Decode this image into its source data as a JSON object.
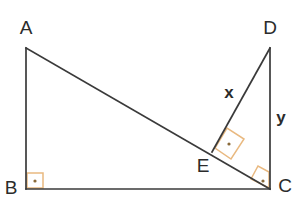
{
  "figure": {
    "background_color": "#ffffff",
    "line_color": "#3a3a3a",
    "label_color": "#2b2b2b",
    "angle_mark_color": "#e9b980",
    "angle_dot_color": "#8a6a3a",
    "vertices": [
      {
        "id": "A",
        "label": "A",
        "x": 26,
        "y": 48,
        "label_x": 26,
        "label_y": 34
      },
      {
        "id": "B",
        "label": "B",
        "x": 26,
        "y": 189,
        "label_x": 11,
        "label_y": 194
      },
      {
        "id": "C",
        "label": "C",
        "x": 270,
        "y": 189,
        "label_x": 285,
        "label_y": 192
      },
      {
        "id": "D",
        "label": "D",
        "x": 270,
        "y": 48,
        "label_x": 270,
        "label_y": 34
      },
      {
        "id": "E",
        "label": "E",
        "x": 212,
        "y": 152,
        "label_x": 203,
        "label_y": 172
      }
    ],
    "segments": [
      {
        "id": "AB",
        "from": "A",
        "to": "B",
        "x1": 26,
        "y1": 48,
        "x2": 26,
        "y2": 189
      },
      {
        "id": "BC",
        "from": "B",
        "to": "C",
        "x1": 26,
        "y1": 189,
        "x2": 270,
        "y2": 189
      },
      {
        "id": "AC",
        "from": "A",
        "to": "C",
        "x1": 26,
        "y1": 48,
        "x2": 270,
        "y2": 189
      },
      {
        "id": "DC",
        "from": "D",
        "to": "C",
        "x1": 270,
        "y1": 48,
        "x2": 270,
        "y2": 189
      },
      {
        "id": "DE",
        "from": "D",
        "to": "E",
        "x1": 270,
        "y1": 48,
        "x2": 212,
        "y2": 152
      }
    ],
    "side_labels": [
      {
        "id": "x",
        "text": "x",
        "segment": "DE",
        "x": 229,
        "y": 98
      },
      {
        "id": "y",
        "text": "y",
        "segment": "DC",
        "x": 281,
        "y": 123
      }
    ],
    "right_angles": [
      {
        "id": "angle-B",
        "at": "B",
        "points": "27,173 43,173 43,188 27,188",
        "dot_x": 35,
        "dot_y": 181
      },
      {
        "id": "angle-E",
        "at": "E",
        "points": "215,148 227,128 244,139 231,159",
        "dot_x": 229,
        "dot_y": 144
      },
      {
        "id": "angle-C",
        "at": "C",
        "points": "251,179 258,166 269,172 269,188",
        "dot_x": 263,
        "dot_y": 181
      }
    ]
  }
}
